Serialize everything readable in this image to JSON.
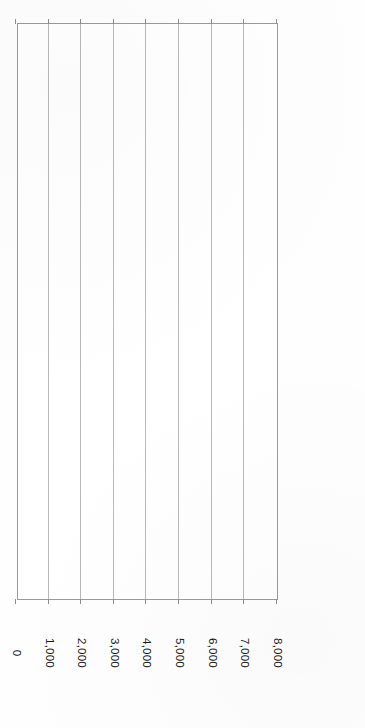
{
  "chart_data": {
    "type": "bar",
    "orientation": "horizontal",
    "title": "",
    "subtitle": "",
    "xlabel": "",
    "ylabel": "",
    "xlim": [
      0,
      8000
    ],
    "grid": true,
    "legend": false,
    "legend_position": "none",
    "rotation_note": "figure rendered upside-down (180 degrees)",
    "axis_tick_labels": [
      "0",
      "1,000",
      "2,000",
      "3,000",
      "4,000",
      "5,000",
      "6,000",
      "7,000",
      "8,000"
    ],
    "axis_tick_values": [
      0,
      1000,
      2000,
      3000,
      4000,
      5000,
      6000,
      7000,
      8000
    ],
    "categories": [
      "New York, NY",
      "Detroit, MI",
      "Boston, MA",
      "Lawrence, MA",
      "Chicago, IL",
      "Worcester, MA",
      "Cleveland, OH",
      "Pittsburgh, PA",
      "Patterson, NJ",
      "Utica, NY",
      "Wilkes-Barre, PA",
      "St. Louis, MO",
      "Fall River, MA",
      "Philadelphia, PA",
      "Akron, OH",
      "Toledo, OH",
      "Highland Park, MI",
      "San Francisco, CA",
      "Springfield, IL",
      "Los Angeles, CA",
      "Pawtucket, RI",
      "Buffalo, NY",
      "Jacksonville, FL"
    ],
    "values": [
      7760,
      3858,
      3150,
      2903,
      1672,
      1448,
      1440,
      1406,
      1252,
      1203,
      1036,
      987,
      971,
      914,
      883,
      874,
      826,
      773,
      696,
      692,
      633,
      627,
      605
    ],
    "value_labels": [
      "7,760",
      "3,858",
      "3,150",
      "2,903",
      "1,672",
      "1,448",
      "1,440",
      "1,406",
      "1,252",
      "1,203",
      "1,036",
      "987",
      "971",
      "914",
      "883",
      "874",
      "826",
      "773",
      "696",
      "692",
      "633",
      "627",
      "605"
    ],
    "colors": {
      "bar_fill": "#a9a9a9",
      "bar_stroke": "#6f6f6f",
      "gridline": "#b9b9b9",
      "frame": "#9a9a9a",
      "text": "#1a1a1a",
      "background": "#ffffff"
    }
  }
}
